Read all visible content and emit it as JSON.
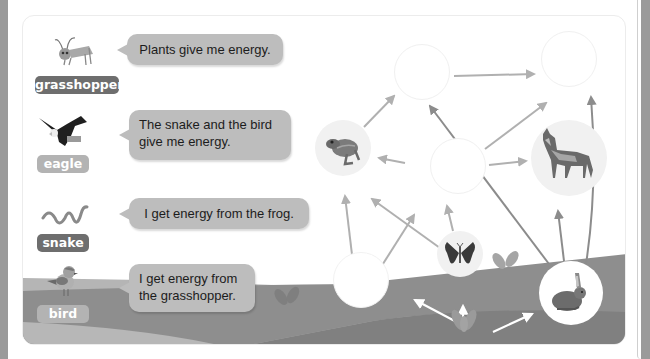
{
  "colors": {
    "bubble": "#bdbdbd",
    "label_dark": "#6e6e6e",
    "label_light": "#b3b3b3",
    "arrow": "#b0b0b0",
    "arrow_dark": "#8c8c8c",
    "ground_light": "#b5b5b5",
    "ground_dark": "#8e8e8e"
  },
  "animals": [
    {
      "id": "grasshopper",
      "label": "grasshopper",
      "icon": "grasshopper-icon",
      "speech": "Plants give me energy."
    },
    {
      "id": "eagle",
      "label": "eagle",
      "icon": "eagle-icon",
      "speech_line1": "The snake and the bird",
      "speech_line2": "give me energy."
    },
    {
      "id": "snake",
      "label": "snake",
      "icon": "snake-icon",
      "speech": "I get energy from the frog."
    },
    {
      "id": "bird",
      "label": "bird",
      "icon": "bird-icon",
      "speech_line1": "I get energy from",
      "speech_line2": "the grasshopper."
    }
  ],
  "food_web": {
    "nodes": [
      {
        "id": "top-center",
        "content": "empty"
      },
      {
        "id": "top-right",
        "content": "empty"
      },
      {
        "id": "frog",
        "content": "frog-icon"
      },
      {
        "id": "center",
        "content": "empty"
      },
      {
        "id": "wolf",
        "content": "wolf-icon"
      },
      {
        "id": "bottom-left",
        "content": "empty"
      },
      {
        "id": "butterfly",
        "content": "butterfly-icon"
      },
      {
        "id": "rabbit",
        "content": "rabbit-icon"
      },
      {
        "id": "plant",
        "content": "plant-icon"
      }
    ]
  }
}
